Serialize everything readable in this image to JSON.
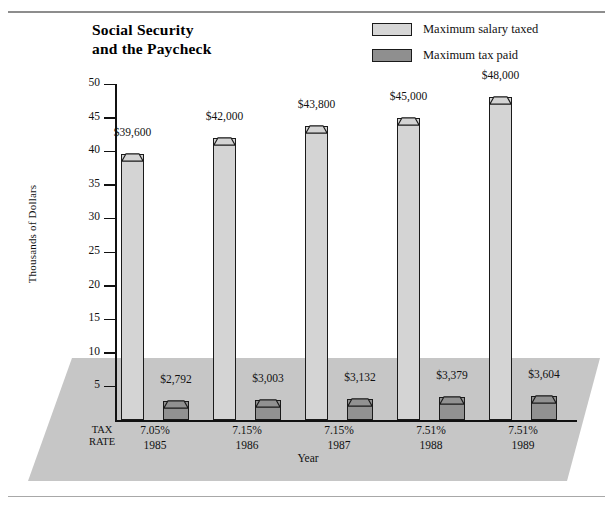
{
  "page": {
    "title_line1": "Social Security",
    "title_line2": "and the Paycheck"
  },
  "legend": {
    "position": "top-right",
    "items": [
      {
        "label": "Maximum salary taxed",
        "color": "#d4d4d4",
        "name": "salary"
      },
      {
        "label": "Maximum tax paid",
        "color": "#919191",
        "name": "tax"
      }
    ]
  },
  "axis": {
    "y_label": "Thousands of Dollars",
    "x_label": "Year",
    "tax_rate_head_line1": "TAX",
    "tax_rate_head_line2": "RATE",
    "y_ticks": [
      "5",
      "10",
      "15",
      "20",
      "25",
      "30",
      "35",
      "40",
      "45",
      "50"
    ]
  },
  "chart_data": {
    "type": "bar",
    "title": "Social Security and the Paycheck",
    "xlabel": "Year",
    "ylabel": "Thousands of Dollars",
    "ylim": [
      0,
      50
    ],
    "ytick_values": [
      5,
      10,
      15,
      20,
      25,
      30,
      35,
      40,
      45,
      50
    ],
    "grid": false,
    "legend_position": "top-right",
    "categories": [
      "1985",
      "1986",
      "1987",
      "1988",
      "1989"
    ],
    "tax_rates": [
      "7.05%",
      "7.15%",
      "7.15%",
      "7.51%",
      "7.51%"
    ],
    "series": [
      {
        "name": "Maximum salary taxed",
        "color": "#d4d4d4",
        "values": [
          39600,
          42000,
          43800,
          45000,
          48000
        ],
        "labels": [
          "$39,600",
          "$42,000",
          "$43,800",
          "$45,000",
          "$48,000"
        ]
      },
      {
        "name": "Maximum tax paid",
        "color": "#919191",
        "values": [
          2792,
          3003,
          3132,
          3379,
          3604
        ],
        "labels": [
          "$2,792",
          "$3,003",
          "$3,132",
          "$3,379",
          "$3,604"
        ]
      }
    ]
  },
  "colors": {
    "salary_bar": "#d4d4d4",
    "tax_bar": "#919191",
    "floor": "#c6c6c6",
    "outline": "#1a1a1a"
  }
}
